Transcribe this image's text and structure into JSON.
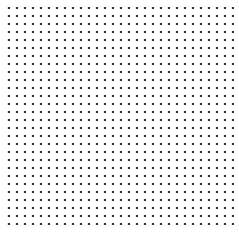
{
  "canvas": {
    "width_px": 239,
    "height_px": 247,
    "background_color": "#ffffff",
    "pattern": {
      "type": "dot-grid",
      "dot_color": "#2e2e2e",
      "dot_halo_color": "#c9c9c9",
      "dot_size_px": 2,
      "spacing_px": 8,
      "offset_x_px": 9,
      "offset_y_px": 8,
      "columns": 29,
      "rows": 28
    }
  }
}
